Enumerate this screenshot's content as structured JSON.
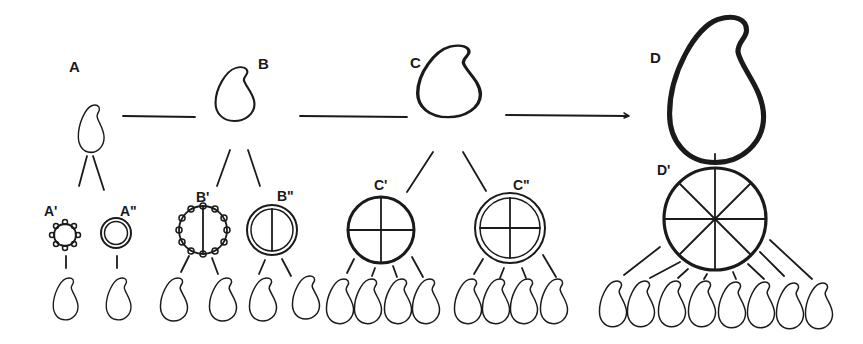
{
  "figure": {
    "stroke_color": "#1a1a1a",
    "background": "#ffffff",
    "labels": {
      "A": "A",
      "A1": "A'",
      "A2": "A\"",
      "B": "B",
      "B1": "B'",
      "B2": "B\"",
      "C": "C",
      "C1": "C'",
      "C2": "C\"",
      "D": "D",
      "D1": "D'"
    },
    "stages": [
      {
        "id": "A",
        "cell_size": "small",
        "divisions": [
          {
            "id": "A'",
            "wall": "ornamented",
            "segments": 1,
            "offspring": 1
          },
          {
            "id": "A\"",
            "wall": "double",
            "segments": 1,
            "offspring": 1
          }
        ]
      },
      {
        "id": "B",
        "cell_size": "medium",
        "divisions": [
          {
            "id": "B'",
            "wall": "ornamented",
            "segments": 2,
            "offspring": 2
          },
          {
            "id": "B\"",
            "wall": "double",
            "segments": 2,
            "offspring": 2
          }
        ]
      },
      {
        "id": "C",
        "cell_size": "large",
        "divisions": [
          {
            "id": "C'",
            "wall": "thick",
            "segments": 4,
            "offspring": 4
          },
          {
            "id": "C\"",
            "wall": "double",
            "segments": 4,
            "offspring": 4
          }
        ]
      },
      {
        "id": "D",
        "cell_size": "very-large",
        "divisions": [
          {
            "id": "D'",
            "wall": "thick",
            "segments": 8,
            "offspring": 8
          }
        ]
      }
    ],
    "connectors": [
      "A-B",
      "B-C",
      "C-D (arrow)"
    ]
  }
}
